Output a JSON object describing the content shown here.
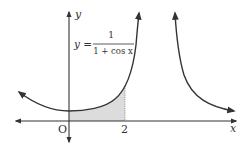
{
  "diagram": {
    "function_label": {
      "lhs": "y =",
      "numerator": "1",
      "denominator": "1 + cos x"
    },
    "axes": {
      "x_label": "x",
      "y_label": "y",
      "origin_label": "O",
      "tick_label": "2"
    },
    "shaded_region": {
      "from": 0,
      "to": 2,
      "color": "#d8d8d8"
    },
    "curve_color": "#333333",
    "axis_color": "#333333"
  }
}
